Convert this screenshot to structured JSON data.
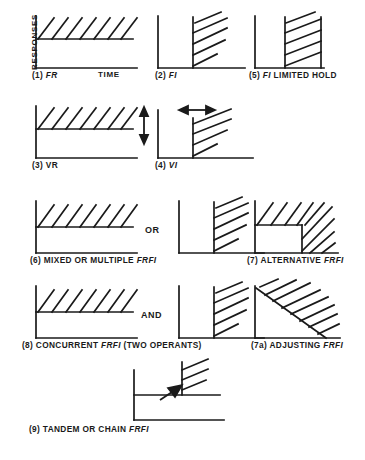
{
  "figure": {
    "title_axis_y": "RESPONSES",
    "title_axis_x": "TIME",
    "connectors": [
      {
        "label": "OR"
      },
      {
        "label": "AND"
      }
    ],
    "stroke_color": "#1a1a1a",
    "background_color": "#ffffff"
  },
  "panels": [
    {
      "id": "fr",
      "number": "(1)",
      "name": "FR",
      "name_italic": true,
      "extra": "",
      "caption_full": "(1)  FR",
      "record_type": "steep-ramp-with-hatch"
    },
    {
      "id": "fi",
      "number": "(2)",
      "name": "FI",
      "name_italic": true,
      "extra": "",
      "caption_full": "(2)  FI",
      "record_type": "scallop-hatch-right"
    },
    {
      "id": "fi-limited-hold",
      "number": "(5)",
      "name": "FI",
      "name_italic": true,
      "extra": " LIMITED HOLD",
      "caption_full": "(5)  FI LIMITED HOLD",
      "record_type": "boxed-hatch-right"
    },
    {
      "id": "vr",
      "number": "(3)",
      "name": "VR",
      "name_italic": false,
      "extra": "",
      "caption_full": "(3)  VR",
      "record_type": "steep-ramp-with-hatch",
      "arrow": "vertical-double"
    },
    {
      "id": "vi",
      "number": "(4)",
      "name": "VI",
      "name_italic": true,
      "extra": "",
      "caption_full": "(4)  VI",
      "record_type": "scallop-hatch-right",
      "arrow": "horizontal-double"
    },
    {
      "id": "mixed-or-multiple",
      "number": "(6)",
      "name": "MIXED OR MULTIPLE",
      "name_italic": false,
      "extra": " FRFI",
      "caption_full": "(6) MIXED OR MULTIPLE FRFI",
      "record_type": "pair-or"
    },
    {
      "id": "alternative",
      "number": "(7)",
      "name": "ALTERNATIVE",
      "name_italic": false,
      "extra": " FRFI",
      "caption_full": "(7) ALTERNATIVE FRFI",
      "record_type": "notched-L-hatch"
    },
    {
      "id": "concurrent",
      "number": "(8)",
      "name": "CONCURRENT",
      "name_italic": false,
      "extra": " FRFI (TWO OPERANTS)",
      "caption_full": "(8) CONCURRENT FRFI (TWO OPERANTS)",
      "record_type": "pair-and"
    },
    {
      "id": "adjusting",
      "number": "(7a)",
      "name": "ADJUSTING",
      "name_italic": false,
      "extra": " FRFI",
      "caption_full": "(7a) ADJUSTING FRFI",
      "record_type": "triangle-hatch"
    },
    {
      "id": "tandem-or-chain",
      "number": "(9)",
      "name": "TANDEM OR CHAIN",
      "name_italic": false,
      "extra": " FRFI",
      "caption_full": "(9) TANDEM OR CHAIN FRFI",
      "record_type": "two-level-arrow"
    }
  ],
  "captions": {
    "fr_num": "(1)",
    "fr_name": "FR",
    "fi_num": "(2)",
    "fi_name": "FI",
    "flh_num": "(5)",
    "flh_name": "FI",
    "flh_rest": " LIMITED HOLD",
    "vr_num": "(3)",
    "vr_name": "VR",
    "vi_num": "(4)",
    "vi_name": "VI",
    "mix_num": "(6)",
    "mix_name": "MIXED OR MULTIPLE",
    "mix_code": "FRFI",
    "alt_num": "(7)",
    "alt_name": "ALTERNATIVE",
    "alt_code": "FRFI",
    "conc_num": "(8)",
    "conc_name": "CONCURRENT",
    "conc_code": "FRFI",
    "conc_rest": "(TWO OPERANTS)",
    "adj_num": "(7a)",
    "adj_name": "ADJUSTING",
    "adj_code": "FRFI",
    "tan_num": "(9)",
    "tan_name": "TANDEM OR CHAIN",
    "tan_code": "FRFI"
  },
  "labels": {
    "responses": "RESPONSES",
    "time": "TIME",
    "or": "OR",
    "and": "AND"
  }
}
